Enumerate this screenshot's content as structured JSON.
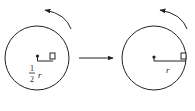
{
  "diagram": {
    "left": {
      "radius_label_num": "1",
      "radius_label_den": "2",
      "radius_label_var": "r"
    },
    "right": {
      "radius_label_var": "r"
    },
    "colors": {
      "stroke": "#222222",
      "background": "#ffffff"
    }
  }
}
